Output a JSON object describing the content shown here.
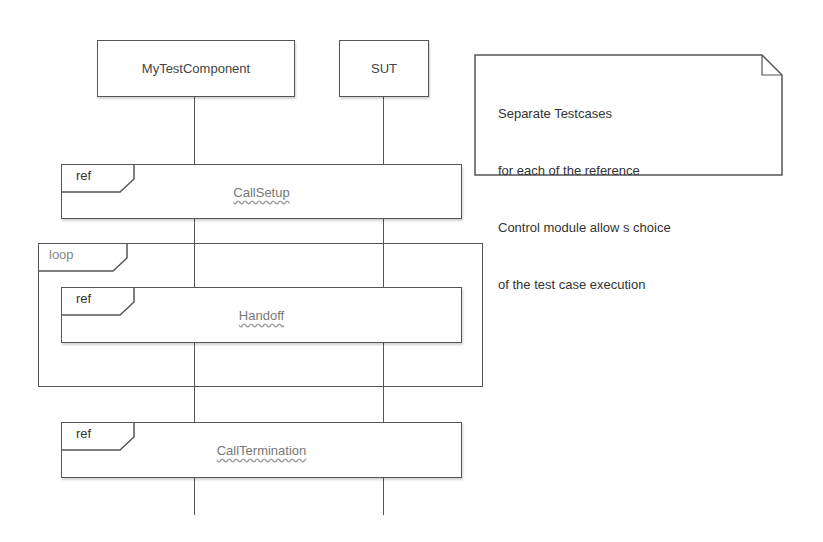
{
  "diagram": {
    "type": "sequence-diagram",
    "instances": [
      {
        "name": "MyTestComponent"
      },
      {
        "name": "SUT"
      }
    ],
    "fragments": [
      {
        "kind": "ref",
        "tag": "ref",
        "name": "CallSetup"
      },
      {
        "kind": "loop",
        "tag": "loop",
        "children": [
          {
            "kind": "ref",
            "tag": "ref",
            "name": "Handoff"
          }
        ]
      },
      {
        "kind": "ref",
        "tag": "ref",
        "name": "CallTermination"
      }
    ],
    "note": {
      "lines": [
        "Separate Testcases",
        "for each of the reference",
        "Control module allow s choice",
        "of the test case execution"
      ]
    }
  }
}
